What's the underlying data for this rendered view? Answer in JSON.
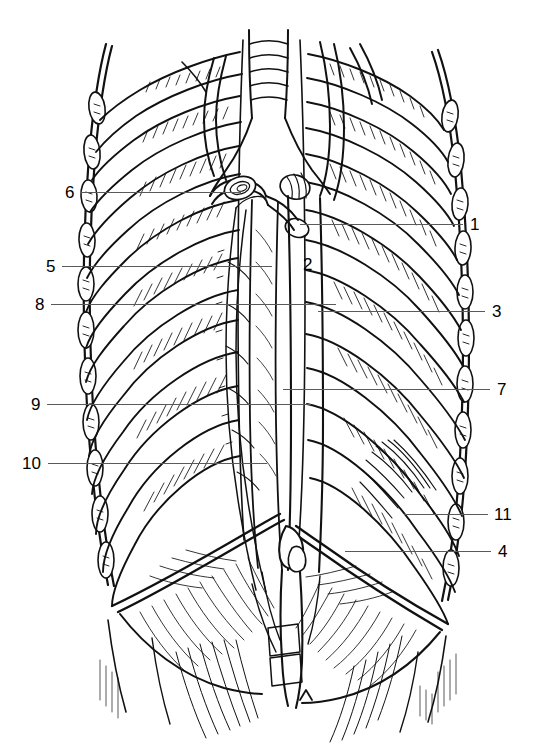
{
  "figure": {
    "domain": "anatomical-line-drawing",
    "title": "",
    "background_color": "#ffffff",
    "ink_color": "#000000",
    "leader_line_color": "#5a5a5a",
    "width": 539,
    "height": 753
  },
  "labels": [
    {
      "id": "1",
      "text": "1",
      "side": "right",
      "text_x": 470,
      "text_y": 216,
      "leader_x": 300,
      "leader_y": 224,
      "leader_w": 163,
      "has_leader": true
    },
    {
      "id": "2",
      "text": "2",
      "side": "inline",
      "text_x": 303,
      "text_y": 256,
      "leader_x": 0,
      "leader_y": 0,
      "leader_w": 0,
      "has_leader": false
    },
    {
      "id": "3",
      "text": "3",
      "side": "right",
      "text_x": 492,
      "text_y": 303,
      "leader_x": 318,
      "leader_y": 311,
      "leader_w": 167,
      "has_leader": true
    },
    {
      "id": "4",
      "text": "4",
      "side": "right",
      "text_x": 498,
      "text_y": 543,
      "leader_x": 345,
      "leader_y": 551,
      "leader_w": 146,
      "has_leader": true
    },
    {
      "id": "5",
      "text": "5",
      "side": "left",
      "text_x": 46,
      "text_y": 258,
      "leader_x": 62,
      "leader_y": 266,
      "leader_w": 210,
      "has_leader": true
    },
    {
      "id": "6",
      "text": "6",
      "side": "left",
      "text_x": 65,
      "text_y": 184,
      "leader_x": 81,
      "leader_y": 192,
      "leader_w": 160,
      "has_leader": true
    },
    {
      "id": "7",
      "text": "7",
      "side": "right",
      "text_x": 497,
      "text_y": 381,
      "leader_x": 283,
      "leader_y": 389,
      "leader_w": 207,
      "has_leader": true
    },
    {
      "id": "8",
      "text": "8",
      "side": "left",
      "text_x": 35,
      "text_y": 296,
      "leader_x": 51,
      "leader_y": 304,
      "leader_w": 285,
      "has_leader": true
    },
    {
      "id": "9",
      "text": "9",
      "side": "left",
      "text_x": 31,
      "text_y": 396,
      "leader_x": 47,
      "leader_y": 404,
      "leader_w": 264,
      "has_leader": true
    },
    {
      "id": "10",
      "text": "10",
      "side": "left",
      "text_x": 22,
      "text_y": 455,
      "leader_x": 48,
      "leader_y": 463,
      "leader_w": 219,
      "has_leader": true
    },
    {
      "id": "11",
      "text": "11",
      "side": "right",
      "text_x": 494,
      "text_y": 506,
      "leader_x": 404,
      "leader_y": 514,
      "leader_w": 84,
      "has_leader": true
    }
  ]
}
